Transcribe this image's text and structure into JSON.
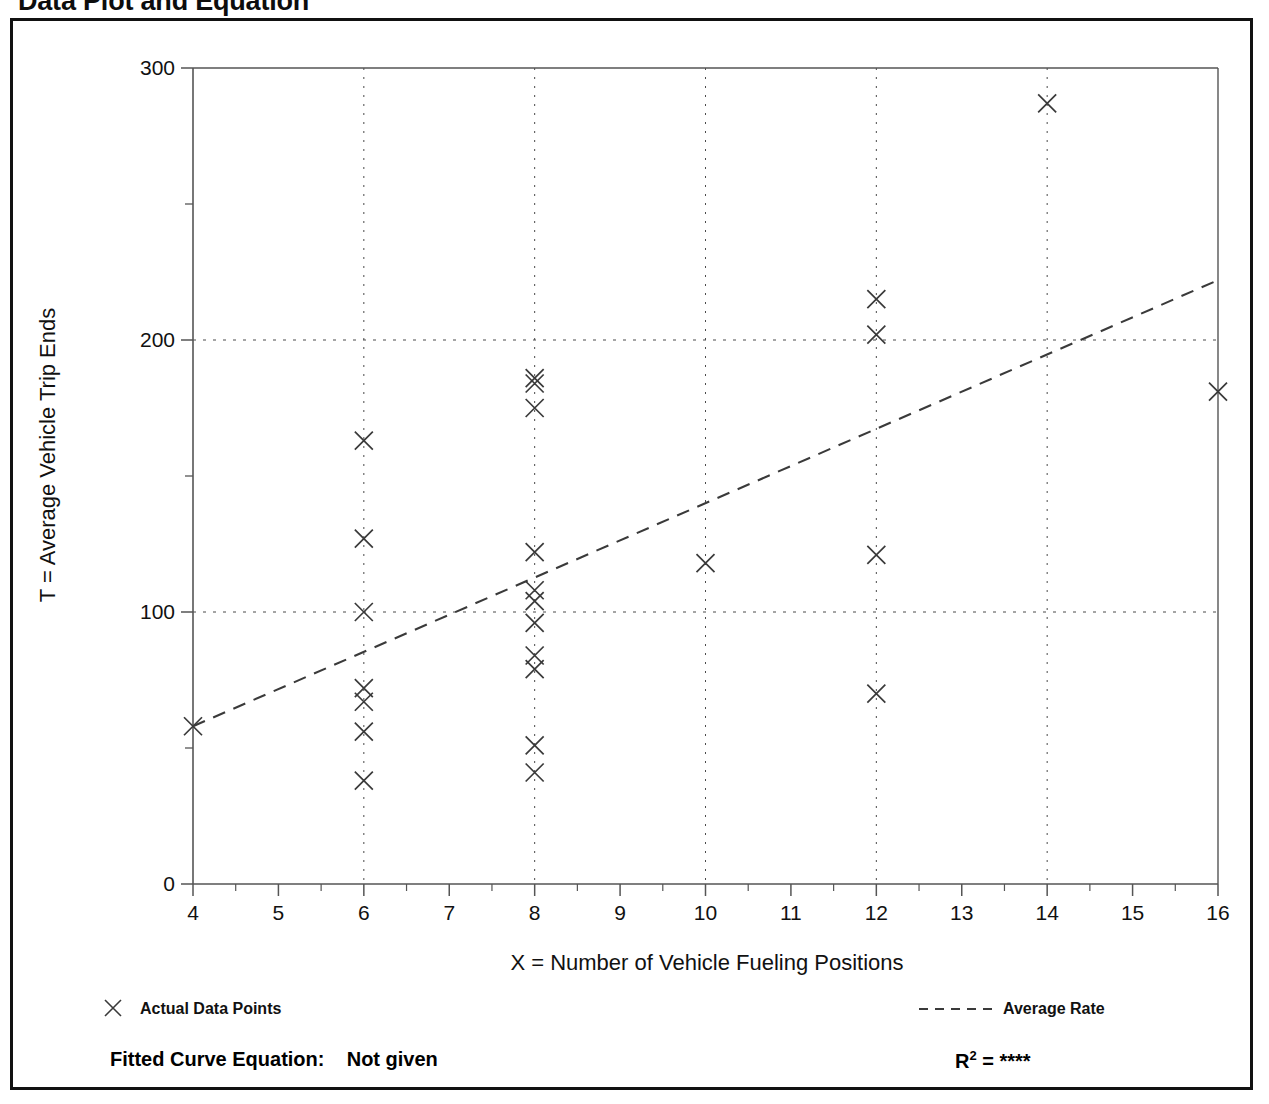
{
  "title": "Data Plot and Equation",
  "axes": {
    "xlabel": "X = Number of Vehicle Fueling Positions",
    "ylabel": "T = Average Vehicle Trip Ends",
    "xticks": [
      "4",
      "5",
      "6",
      "7",
      "8",
      "9",
      "10",
      "11",
      "12",
      "13",
      "14",
      "15",
      "16"
    ],
    "yticks": [
      "0",
      "100",
      "200",
      "300"
    ]
  },
  "legend": {
    "points_label": "Actual Data Points",
    "points_marker": "x-marker-icon",
    "line_label": "Average Rate",
    "line_marker": "dashed-line-icon"
  },
  "footer": {
    "equation_label": "Fitted Curve Equation:",
    "equation_value": "Not given",
    "r2_label": "R",
    "r2_exponent": "2",
    "r2_eq": "=",
    "r2_value": "****"
  },
  "colors": {
    "marker": "#3a3a3a",
    "line": "#3a3a3a",
    "grid": "#4a4a4a",
    "axis": "#555555",
    "frame": "#111111",
    "text": "#111111"
  },
  "chart_data": {
    "type": "scatter",
    "title": "Data Plot and Equation",
    "xlabel": "X = Number of Vehicle Fueling Positions",
    "ylabel": "T = Average Vehicle Trip Ends",
    "xlim": [
      4,
      16
    ],
    "ylim": [
      0,
      300
    ],
    "xticks": [
      4,
      5,
      6,
      7,
      8,
      9,
      10,
      11,
      12,
      13,
      14,
      15,
      16
    ],
    "yticks": [
      0,
      100,
      200,
      300
    ],
    "grid": "dotted vertical gridlines at even x (6,8,10,12,14); dotted horizontal gridlines at 100 and 200",
    "legend_position": "below plot, points left / line right",
    "series": [
      {
        "name": "Actual Data Points",
        "marker": "x",
        "points": [
          [
            4,
            58
          ],
          [
            6,
            163
          ],
          [
            6,
            127
          ],
          [
            6,
            100
          ],
          [
            6,
            72
          ],
          [
            6,
            67
          ],
          [
            6,
            56
          ],
          [
            6,
            38
          ],
          [
            8,
            186
          ],
          [
            8,
            184
          ],
          [
            8,
            175
          ],
          [
            8,
            122
          ],
          [
            8,
            108
          ],
          [
            8,
            104
          ],
          [
            8,
            96
          ],
          [
            8,
            84
          ],
          [
            8,
            79
          ],
          [
            8,
            51
          ],
          [
            8,
            41
          ],
          [
            10,
            118
          ],
          [
            12,
            215
          ],
          [
            12,
            202
          ],
          [
            12,
            121
          ],
          [
            12,
            70
          ],
          [
            14,
            287
          ],
          [
            16,
            181
          ]
        ]
      },
      {
        "name": "Average Rate",
        "type": "line",
        "style": "dashed",
        "points": [
          [
            4,
            58
          ],
          [
            16,
            222
          ]
        ]
      }
    ]
  }
}
